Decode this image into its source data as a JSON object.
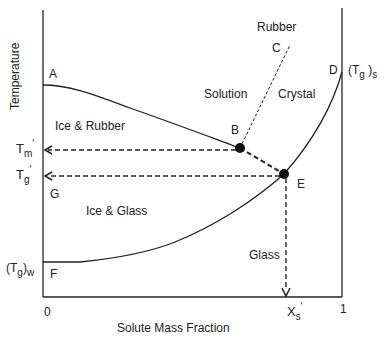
{
  "axes": {
    "y_label": "Temperature",
    "x_label": "Solute Mass Fraction",
    "x_tick_0": "0",
    "x_tick_1": "1"
  },
  "points": {
    "A": "A",
    "B": "B",
    "C": "C",
    "D": "D",
    "E": "E",
    "F": "F",
    "G": "G"
  },
  "regions": {
    "ice_rubber": "Ice & Rubber",
    "ice_glass": "Ice & Glass",
    "solution": "Solution",
    "crystal": "Crystal",
    "rubber": "Rubber",
    "glass": "Glass"
  },
  "y_markers": {
    "tm_base": "T",
    "tm_sub": "m",
    "tm_prime": "'",
    "tg_base": "T",
    "tg_sub": "g",
    "tg_prime": "'",
    "tgw_base": "(T",
    "tgw_sub1": "g",
    "tgw_close": ")",
    "tgw_sub2": "w"
  },
  "right_marker": {
    "base": "(T",
    "sub1": "g",
    "close": " )",
    "sub2": "s"
  },
  "x_marker": {
    "base": "X",
    "sub": "s",
    "prime": "'"
  }
}
